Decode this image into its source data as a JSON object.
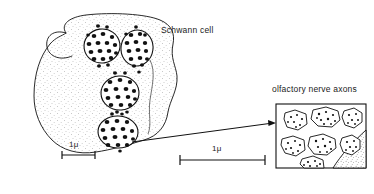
{
  "figure": {
    "type": "scientific-line-diagram",
    "background_color": "#ffffff",
    "ink_color": "#111111"
  },
  "labels": {
    "schwann_cell": "Schwann cell",
    "olfactory_nerve_axons": "olfactory nerve axons"
  },
  "scale_bars": [
    {
      "id": "overview",
      "label": "1μ",
      "length_px": 33,
      "x1": 62,
      "x2": 95,
      "y": 155
    },
    {
      "id": "inset",
      "label": "1μ",
      "length_px": 85,
      "x1": 180,
      "x2": 265,
      "y": 160
    }
  ],
  "overview": {
    "schwann_cell_outline": "M 66 33 C 60 24 70 17 86 15 C 112 12 146 14 160 20 C 172 25 175 34 173 44 C 170 58 176 66 177 76 C 178 90 170 100 168 112 C 166 126 158 136 144 140 C 128 145 110 150 96 152 C 78 155 62 150 52 140 C 40 128 34 112 34 96 C 34 74 40 56 50 44 C 56 37 62 36 66 33 Z",
    "hook_path": "M 66 33 C 55 30 48 36 50 46 C 52 55 62 58 70 54",
    "fascicles": [
      {
        "id": "fascicle-1",
        "cx": 102,
        "cy": 46,
        "rx": 18,
        "ry": 17,
        "rot": -8,
        "axon_count": 19
      },
      {
        "id": "fascicle-2",
        "cx": 137,
        "cy": 48,
        "rx": 16,
        "ry": 18,
        "rot": 8,
        "axon_count": 17
      },
      {
        "id": "fascicle-3",
        "cx": 120,
        "cy": 93,
        "rx": 19,
        "ry": 17,
        "rot": -4,
        "axon_count": 18
      },
      {
        "id": "fascicle-4",
        "cx": 118,
        "cy": 132,
        "rx": 20,
        "ry": 16,
        "rot": 3,
        "axon_count": 17
      }
    ]
  },
  "arrow": {
    "from_x": 132,
    "from_y": 142,
    "to_x": 276,
    "to_y": 123,
    "head_size": 5
  },
  "inset": {
    "box": {
      "x": 276,
      "y": 104,
      "width": 90,
      "height": 64
    },
    "border_color": "#111111",
    "axons": [
      {
        "cx": 296,
        "cy": 120,
        "rx": 12,
        "ry": 10,
        "rot": -18,
        "dots": 7
      },
      {
        "cx": 326,
        "cy": 117,
        "rx": 14,
        "ry": 10,
        "rot": 6,
        "dots": 9
      },
      {
        "cx": 352,
        "cy": 118,
        "rx": 11,
        "ry": 10,
        "rot": -6,
        "dots": 6
      },
      {
        "cx": 293,
        "cy": 146,
        "rx": 12,
        "ry": 10,
        "rot": 12,
        "dots": 7
      },
      {
        "cx": 322,
        "cy": 145,
        "rx": 13,
        "ry": 10,
        "rot": -4,
        "dots": 8
      },
      {
        "cx": 350,
        "cy": 144,
        "rx": 11,
        "ry": 10,
        "rot": 10,
        "dots": 6
      },
      {
        "cx": 312,
        "cy": 165,
        "rx": 12,
        "ry": 9,
        "rot": -10,
        "dots": 6
      }
    ],
    "cytoplasm_band": "M 366 134 C 352 146 340 158 332 168 L 366 168 Z"
  }
}
